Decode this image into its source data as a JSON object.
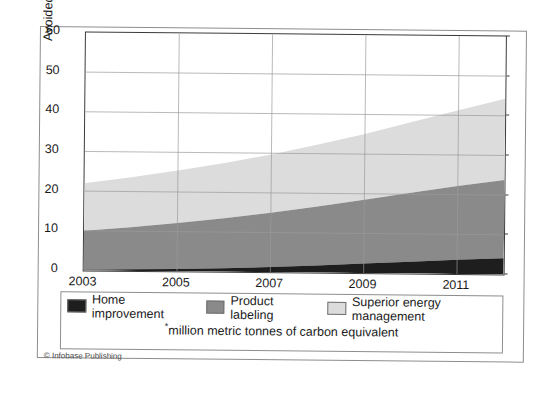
{
  "chart_data": {
    "type": "area",
    "stacked": true,
    "title": "",
    "xlabel": "",
    "ylabel": "Avoided Carbon Emissions (mmtce*)",
    "ylabel_text": "Avoided Carbon Emissions (mmtce",
    "ylabel_superscript": "*",
    "ylabel_suffix": ")",
    "xlim": [
      2003,
      2012
    ],
    "ylim": [
      0,
      60
    ],
    "ytick_labels": [
      "60",
      "50",
      "40",
      "30",
      "20",
      "10",
      "0"
    ],
    "ytick_values": [
      60,
      50,
      40,
      30,
      20,
      10,
      0
    ],
    "xtick_labels": [
      "2003",
      "2005",
      "2007",
      "2009",
      "2011"
    ],
    "xtick_values": [
      2003,
      2005,
      2007,
      2009,
      2011
    ],
    "grid": true,
    "legend_position": "below-plot",
    "x": [
      2003,
      2004,
      2005,
      2006,
      2007,
      2008,
      2009,
      2010,
      2011,
      2012
    ],
    "series": [
      {
        "name": "Home improvement",
        "color": "#1e1e1e",
        "values": [
          0.2,
          0.4,
          0.6,
          0.9,
          1.3,
          1.8,
          2.4,
          3.0,
          3.6,
          4.1
        ]
      },
      {
        "name": "Product labeling",
        "color": "#8a8a8a",
        "values": [
          9.8,
          10.6,
          11.6,
          12.6,
          13.7,
          14.9,
          16.1,
          17.4,
          18.6,
          19.7
        ]
      },
      {
        "name": "Superior energy management",
        "color": "#dcdcdc",
        "values": [
          12.0,
          12.6,
          13.2,
          13.9,
          14.7,
          15.6,
          16.6,
          17.8,
          19.1,
          20.5
        ]
      }
    ],
    "cumulative_totals": [
      22.0,
      23.6,
      25.4,
      27.4,
      29.7,
      32.3,
      35.1,
      38.2,
      41.3,
      44.3
    ],
    "annotations": {
      "footnote": "*million metric tonnes of carbon equivalent",
      "footnote_marker": "*",
      "footnote_text": "million metric tonnes of carbon equivalent"
    }
  },
  "legend": {
    "items": [
      {
        "label": "Home improvement",
        "color": "#1e1e1e"
      },
      {
        "label": "Product labeling",
        "color": "#8a8a8a"
      },
      {
        "label": "Superior energy management",
        "color": "#dcdcdc"
      }
    ]
  },
  "credits": {
    "copyright": "© Infobase Publishing"
  }
}
